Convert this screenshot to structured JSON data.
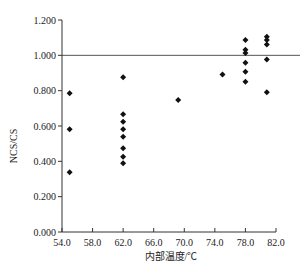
{
  "chart_data": {
    "type": "scatter",
    "title": "",
    "xlabel": "内部温度/℃",
    "ylabel": "NCS/CS",
    "xlim": [
      54.0,
      82.0
    ],
    "ylim": [
      0.0,
      1.2
    ],
    "x_ticks": [
      "54.0",
      "58.0",
      "62.0",
      "66.0",
      "70.0",
      "74.0",
      "78.0",
      "82.0"
    ],
    "x_tick_values": [
      54,
      58,
      62,
      66,
      70,
      74,
      78,
      82
    ],
    "y_ticks": [
      "0.000",
      "0.200",
      "0.400",
      "0.600",
      "0.800",
      "1.000",
      "1.200"
    ],
    "y_tick_values": [
      0,
      0.2,
      0.4,
      0.6,
      0.8,
      1.0,
      1.2
    ],
    "grid": false,
    "legend": "none",
    "reference_line": {
      "y": 1.0
    },
    "marker": "diamond",
    "series": [
      {
        "name": "NCS/CS",
        "points": [
          {
            "x": 55.0,
            "y": 0.785
          },
          {
            "x": 55.0,
            "y": 0.581
          },
          {
            "x": 55.0,
            "y": 0.338
          },
          {
            "x": 62.0,
            "y": 0.876
          },
          {
            "x": 62.0,
            "y": 0.666
          },
          {
            "x": 62.0,
            "y": 0.624
          },
          {
            "x": 62.0,
            "y": 0.581
          },
          {
            "x": 62.0,
            "y": 0.539
          },
          {
            "x": 62.0,
            "y": 0.474
          },
          {
            "x": 62.0,
            "y": 0.426
          },
          {
            "x": 62.0,
            "y": 0.389
          },
          {
            "x": 69.2,
            "y": 0.747
          },
          {
            "x": 75.0,
            "y": 0.892
          },
          {
            "x": 78.0,
            "y": 1.087
          },
          {
            "x": 78.0,
            "y": 1.032
          },
          {
            "x": 78.0,
            "y": 1.013
          },
          {
            "x": 78.0,
            "y": 0.958
          },
          {
            "x": 78.0,
            "y": 0.907
          },
          {
            "x": 78.0,
            "y": 0.851
          },
          {
            "x": 80.8,
            "y": 1.105
          },
          {
            "x": 80.8,
            "y": 1.087
          },
          {
            "x": 80.8,
            "y": 1.062
          },
          {
            "x": 80.8,
            "y": 0.977
          },
          {
            "x": 80.8,
            "y": 0.791
          }
        ]
      }
    ]
  }
}
